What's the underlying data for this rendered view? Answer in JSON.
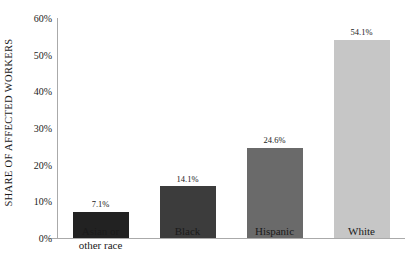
{
  "chart_data": {
    "type": "bar",
    "title": "",
    "subtitle": "",
    "xlabel": "",
    "ylabel": "SHARE OF AFFECTED WORKERS",
    "categories": [
      "Asian or\nother race",
      "Black",
      "Hispanic",
      "White"
    ],
    "values": [
      7.1,
      14.1,
      24.6,
      54.1
    ],
    "value_labels": [
      "7.1%",
      "14.1%",
      "24.6%",
      "54.1%"
    ],
    "bar_colors": [
      "#222222",
      "#3c3c3c",
      "#6a6a6a",
      "#c6c6c6"
    ],
    "ylim": [
      0,
      60
    ],
    "ytick_values": [
      0,
      10,
      20,
      30,
      40,
      50,
      60
    ],
    "ytick_labels": [
      "0%",
      "10%",
      "20%",
      "30%",
      "40%",
      "50%",
      "60%"
    ],
    "grid": false,
    "legend": false,
    "legend_position": "none",
    "axis_color": "#aaaaaa",
    "background": "#ffffff",
    "text_color": "#1a1a1a"
  }
}
